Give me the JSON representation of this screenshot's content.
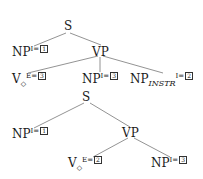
{
  "trees": [
    {
      "root": {
        "label": "S"
      },
      "subject": {
        "cat": "NP",
        "feature": "I",
        "index": "1"
      },
      "vp": {
        "label": "VP"
      },
      "verb": {
        "cat": "V",
        "sub": "◇",
        "feature": "E",
        "index": "3"
      },
      "object": {
        "cat": "NP",
        "feature": "I",
        "index": "3"
      },
      "instr": {
        "cat": "NP",
        "sub": "INSTR",
        "feature": "I",
        "index": "2"
      }
    },
    {
      "root": {
        "label": "S"
      },
      "subject": {
        "cat": "NP",
        "feature": "I",
        "index": "1"
      },
      "vp": {
        "label": "VP"
      },
      "verb": {
        "cat": "V",
        "sub": "◇",
        "feature": "E",
        "index": "2"
      },
      "object": {
        "cat": "NP",
        "feature": "I",
        "index": "3"
      }
    }
  ],
  "eq": "="
}
